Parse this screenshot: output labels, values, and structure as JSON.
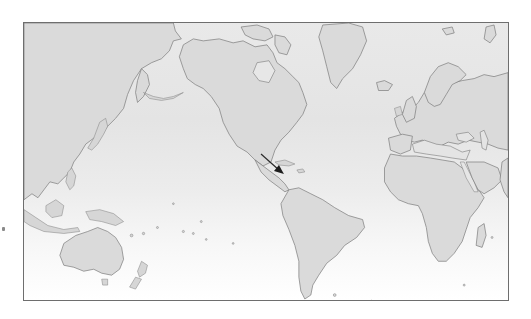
{
  "map": {
    "type": "world-map",
    "projection": "mercator",
    "center": "pacific",
    "style": "grayscale",
    "colors": {
      "land": "#dadada",
      "coastline": "#7a7a7a",
      "ocean_top": "#e9e9e9",
      "ocean_bottom": "#ffffff",
      "frame": "#6e6e6e",
      "arrow": "#1e1e1e"
    },
    "regions_visible": [
      "Asia",
      "Australia",
      "New Zealand",
      "Pacific Islands",
      "North America",
      "Central America",
      "Caribbean",
      "South America",
      "Greenland",
      "Iceland",
      "Europe",
      "Africa",
      "Madagascar",
      "Middle East"
    ],
    "annotation": {
      "type": "arrow",
      "direction": "down-right",
      "points_to": "Caribbean"
    }
  }
}
